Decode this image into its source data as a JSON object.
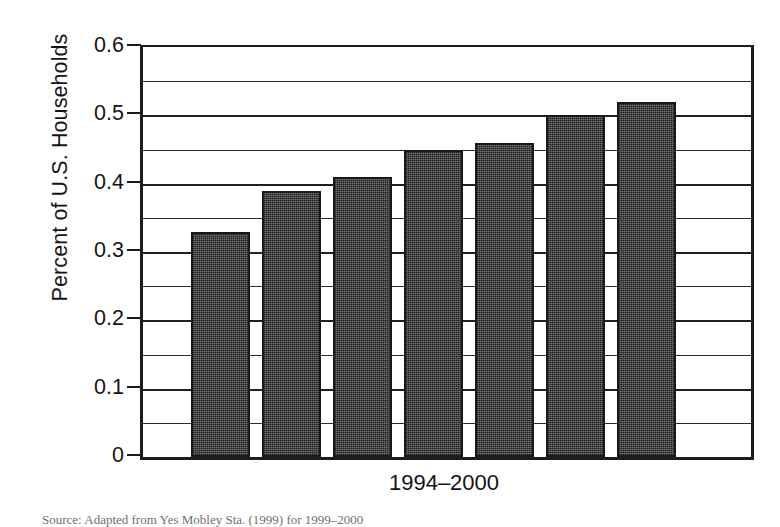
{
  "figure": {
    "y_axis_title": "Percent of U.S. Households",
    "x_axis_label": "1994–2000",
    "source_caption": "Source: Adapted from Yes Mobley Sta. (1999) for 1999–2000",
    "bar_color": "#4a4a4a",
    "bar_border_color": "#191919",
    "axis_color": "#1d1d1d",
    "gridline_color": "#2b2b2b"
  },
  "chart_data": {
    "type": "bar",
    "title": "",
    "subtitle": "",
    "xlabel": "1994–2000",
    "ylabel": "Percent of U.S. Households",
    "categories": [
      "1994",
      "1995",
      "1996",
      "1997",
      "1998",
      "1999",
      "2000"
    ],
    "values": [
      0.33,
      0.39,
      0.41,
      0.45,
      0.46,
      0.5,
      0.52
    ],
    "ylim": [
      0,
      0.6
    ],
    "ytick_values": [
      0,
      0.1,
      0.2,
      0.3,
      0.4,
      0.5,
      0.6
    ],
    "ytick_labels": [
      "0",
      "0.1",
      "0.2",
      "0.3",
      "0.4",
      "0.5",
      "0.6"
    ],
    "minor_gridline_values": [
      0.05,
      0.15,
      0.25,
      0.35,
      0.45,
      0.55
    ],
    "grid": true,
    "grid_axis": "y",
    "legend": false,
    "legend_position": "none",
    "annotations": []
  }
}
